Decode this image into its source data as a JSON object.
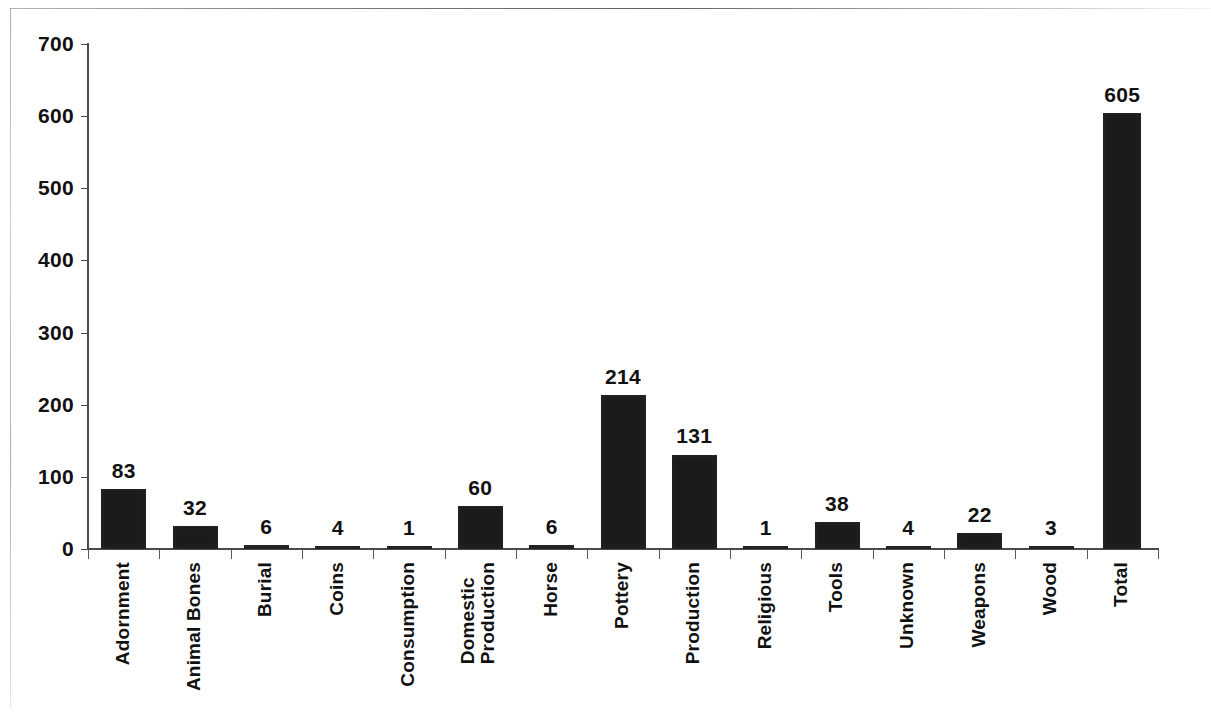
{
  "page": {
    "background_color": "#ffffff",
    "ink_color": "#1b1b1b",
    "axis_color": "#4a4a4a"
  },
  "chart_data": {
    "type": "bar",
    "title": "",
    "subtitle": "",
    "xlabel": "",
    "ylabel": "",
    "ylim": [
      0,
      700
    ],
    "ytick_step": 100,
    "ytick_labels": [
      "700",
      "600",
      "500",
      "400",
      "300",
      "200",
      "100",
      "0"
    ],
    "ytick_values": [
      700,
      600,
      500,
      400,
      300,
      200,
      100,
      0
    ],
    "grid": false,
    "legend": null,
    "legend_position": "none",
    "bar_color": "#1b1b1b",
    "data_labels_shown": true,
    "categories": [
      "Adornment",
      "Animal Bones",
      "Burial",
      "Coins",
      "Consumption",
      "Domestic Production",
      "Horse",
      "Pottery",
      "Production",
      "Religious",
      "Tools",
      "Unknown",
      "Weapons",
      "Wood",
      "Total"
    ],
    "category_label_lines": [
      [
        "Adornment"
      ],
      [
        "Animal Bones"
      ],
      [
        "Burial"
      ],
      [
        "Coins"
      ],
      [
        "Consumption"
      ],
      [
        "Domestic",
        "Production"
      ],
      [
        "Horse"
      ],
      [
        "Pottery"
      ],
      [
        "Production"
      ],
      [
        "Religious"
      ],
      [
        "Tools"
      ],
      [
        "Unknown"
      ],
      [
        "Weapons"
      ],
      [
        "Wood"
      ],
      [
        "Total"
      ]
    ],
    "values": [
      83,
      32,
      6,
      4,
      1,
      60,
      6,
      214,
      131,
      1,
      38,
      4,
      22,
      3,
      605
    ],
    "value_labels": [
      "83",
      "32",
      "6",
      "4",
      "1",
      "60",
      "6",
      "214",
      "131",
      "1",
      "38",
      "4",
      "22",
      "3",
      "605"
    ]
  }
}
